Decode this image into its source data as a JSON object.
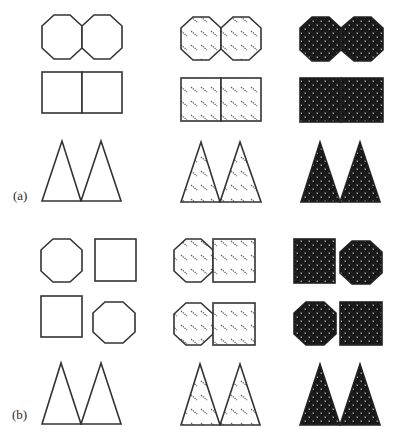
{
  "figure": {
    "panels": [
      {
        "label": "(a)",
        "description": "Grouping by proximity/similarity: pairs of octagons, pairs of squares, pairs of triangles in three texture conditions",
        "columns": [
          "outline",
          "hatched",
          "dotted-dark"
        ],
        "rows": [
          {
            "name": "octagon-pair",
            "shapes": [
              "octagon",
              "octagon"
            ]
          },
          {
            "name": "square-pair",
            "shapes": [
              "square",
              "square"
            ]
          },
          {
            "name": "triangle-pair",
            "shapes": [
              "triangle",
              "triangle"
            ]
          }
        ]
      },
      {
        "label": "(b)",
        "description": "Mixed octagon/square arrangement with triangles below in three texture conditions",
        "columns": [
          "outline",
          "hatched",
          "dotted-dark"
        ],
        "rows": [
          {
            "name": "mixed-row-1",
            "shapes_by_column": [
              [
                "octagon",
                "square"
              ],
              [
                "octagon",
                "square"
              ],
              [
                "square",
                "octagon"
              ]
            ]
          },
          {
            "name": "mixed-row-2",
            "shapes_by_column": [
              [
                "square",
                "octagon"
              ],
              [
                "octagon",
                "square"
              ],
              [
                "octagon",
                "square"
              ]
            ]
          },
          {
            "name": "triangle-pair",
            "shapes": [
              "triangle",
              "triangle"
            ]
          }
        ]
      }
    ],
    "textures": {
      "outline": "none",
      "hatched": "diagonal-dashes",
      "dotted-dark": "checker-with-black-dots"
    },
    "colors": {
      "stroke": "#333333",
      "dark_fill": "#1a1a1a",
      "hatch": "#555555",
      "background": "#ffffff"
    }
  }
}
